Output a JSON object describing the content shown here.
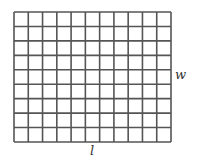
{
  "diagram": {
    "type": "rectangle-grid",
    "columns": 11,
    "rows": 9,
    "line_color": "#555555",
    "labels": {
      "length": "l",
      "width": "w"
    }
  }
}
